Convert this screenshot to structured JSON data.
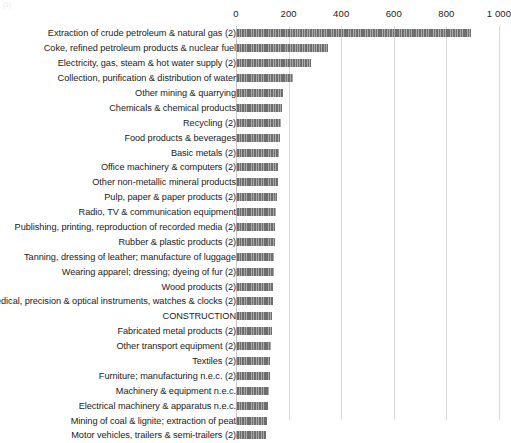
{
  "chart_data": {
    "type": "bar",
    "orientation": "horizontal",
    "title": "",
    "xlabel": "",
    "ylabel": "",
    "xlim": [
      0,
      1000
    ],
    "grid": true,
    "legend": null,
    "axis_ticks": [
      {
        "label": "0",
        "value": 0
      },
      {
        "label": "200",
        "value": 200
      },
      {
        "label": "400",
        "value": 400
      },
      {
        "label": "600",
        "value": 600
      },
      {
        "label": "800",
        "value": 800
      },
      {
        "label": "1 000",
        "value": 1000
      }
    ],
    "categories": [
      "Extraction of crude petroleum & natural gas (2)",
      "Coke, refined petroleum products & nuclear fuel",
      "Electricity, gas, steam & hot water supply (2)",
      "Collection, purification & distribution of water",
      "Other mining & quarrying",
      "Chemicals & chemical products",
      "Recycling (2)",
      "Food products & beverages",
      "Basic metals (2)",
      "Office machinery & computers (2)",
      "Other non-metallic mineral products",
      "Pulp, paper & paper products (2)",
      "Radio, TV & communication equipment",
      "Publishing, printing, reproduction of recorded media (2)",
      "Rubber & plastic products (2)",
      "Tanning, dressing of leather; manufacture of luggage",
      "Wearing apparel; dressing; dyeing of fur (2)",
      "Wood products (2)",
      "Medical, precision & optical instruments, watches & clocks (2)",
      "CONSTRUCTION",
      "Fabricated metal products (2)",
      "Other transport equipment (2)",
      "Textiles (2)",
      "Furniture; manufacturing n.e.c. (2)",
      "Machinery & equipment n.e.c.",
      "Electrical machinery & apparatus n.e.c.",
      "Mining of coal & lignite; extraction of peat",
      "Motor vehicles, trailers & semi-trailers (2)"
    ],
    "values": [
      895,
      349,
      284,
      216,
      178,
      174,
      171,
      168,
      164,
      161,
      158,
      155,
      152,
      150,
      148,
      146,
      144,
      142,
      140,
      138,
      136,
      134,
      131,
      128,
      125,
      122,
      118,
      114
    ],
    "colors": {
      "bar": "#6e6e6e",
      "gridline": "#d8d8d8",
      "text": "#1a1a1a",
      "background": "#ffffff"
    }
  }
}
